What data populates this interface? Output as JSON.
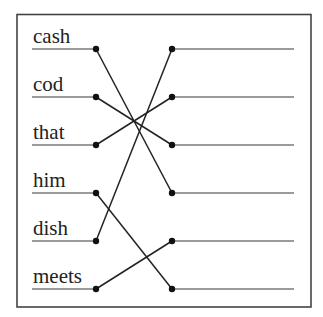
{
  "left_words": [
    {
      "label": "cash"
    },
    {
      "label": "cod"
    },
    {
      "label": "that"
    },
    {
      "label": "him"
    },
    {
      "label": "dish"
    },
    {
      "label": "meets"
    }
  ],
  "right_slots": [
    {
      "label": ""
    },
    {
      "label": ""
    },
    {
      "label": ""
    },
    {
      "label": ""
    },
    {
      "label": ""
    },
    {
      "label": ""
    }
  ],
  "connections": [
    {
      "from": 0,
      "to": 3
    },
    {
      "from": 1,
      "to": 2
    },
    {
      "from": 2,
      "to": 1
    },
    {
      "from": 3,
      "to": 5
    },
    {
      "from": 4,
      "to": 0
    },
    {
      "from": 5,
      "to": 4
    }
  ],
  "colors": {
    "frame": "#444444",
    "underline": "#7a7a7a",
    "connector": "#222222",
    "dot": "#111111",
    "text": "#222222"
  }
}
